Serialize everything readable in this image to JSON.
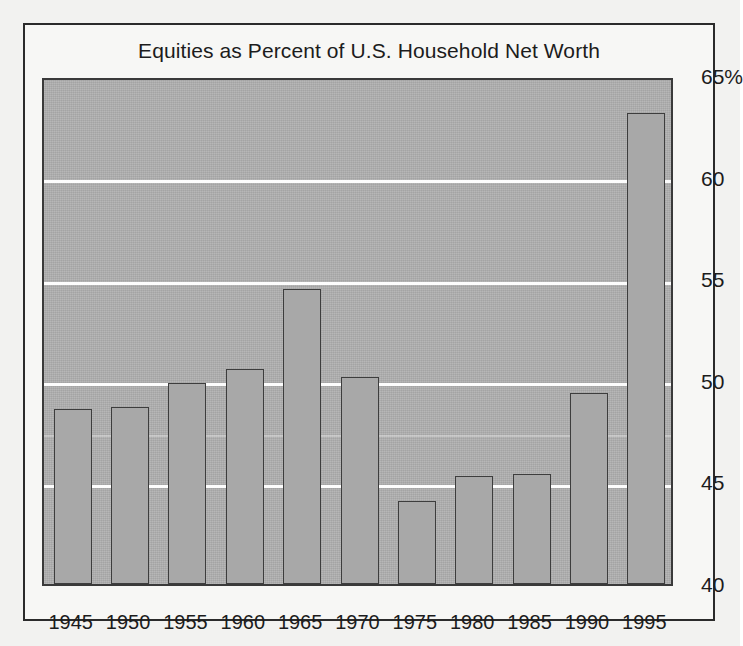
{
  "chart_data": {
    "type": "bar",
    "title": "Equities as Percent of U.S. Household Net Worth",
    "xlabel": "",
    "ylabel": "",
    "categories": [
      "1945",
      "1950",
      "1955",
      "1960",
      "1965",
      "1970",
      "1975",
      "1980",
      "1985",
      "1990",
      "1995"
    ],
    "values": [
      48.6,
      48.7,
      49.9,
      50.6,
      54.5,
      50.2,
      44.1,
      45.3,
      45.4,
      49.4,
      63.2
    ],
    "ylim": [
      40,
      65
    ],
    "yticks": [
      40,
      45,
      50,
      55,
      60,
      65
    ],
    "ytick_labels": [
      "40",
      "45",
      "50",
      "55",
      "60",
      "65%"
    ],
    "gridlines": true,
    "grid_axis": "y",
    "legend": "none",
    "bar_color": "#a8a8a8",
    "bar_edge_color": "#3d3d3d",
    "plot_background": "#b0b0b0",
    "gridline_color": "#fdfdfd",
    "page_background": "#f2f2f0",
    "frame_color": "#2b2b2b",
    "text_color": "#1c1c1c"
  },
  "figure": {
    "title": "Equities as Percent of U.S. Household Net Worth"
  }
}
